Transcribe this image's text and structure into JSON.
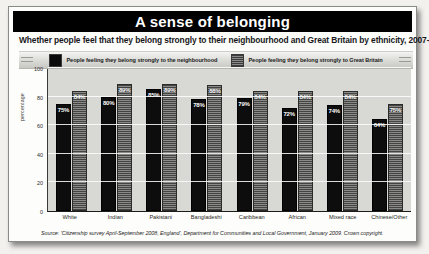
{
  "chart_data": {
    "type": "bar",
    "title": "A sense of belonging",
    "subtitle": "Whether people feel that they belong strongly to their neighbourhood and Great Britain by ethnicity, 2007-08.",
    "xlabel": "",
    "ylabel": "percentage",
    "ylim": [
      0,
      100
    ],
    "yticks": [
      "0",
      "20",
      "40",
      "60",
      "80",
      "100"
    ],
    "grid": true,
    "legend_position": "top",
    "categories": [
      "White",
      "Indian",
      "Pakistani",
      "Bangladeshi",
      "Caribbean",
      "African",
      "Mixed race",
      "Chinese/Other"
    ],
    "series": [
      {
        "name": "People feeling they belong strongly to the neighbourhood",
        "color": "#0d0d0d",
        "values": [
          75,
          80,
          85,
          78,
          79,
          72,
          74,
          64
        ],
        "labels": [
          "75%",
          "80%",
          "85%",
          "78%",
          "79%",
          "72%",
          "74%",
          "64%"
        ]
      },
      {
        "name": "People feeling they belong strongly to Great Britain",
        "color": "#6d6d6b",
        "values": [
          84,
          89,
          89,
          88,
          84,
          84,
          84,
          75
        ],
        "labels": [
          "84%",
          "89%",
          "89%",
          "88%",
          "84%",
          "84%",
          "84%",
          "75%"
        ]
      }
    ],
    "source": "Source: 'Citizenship survey April-September 2008, England', Department for Communities and Local Government, January 2009. Crown copyright."
  }
}
